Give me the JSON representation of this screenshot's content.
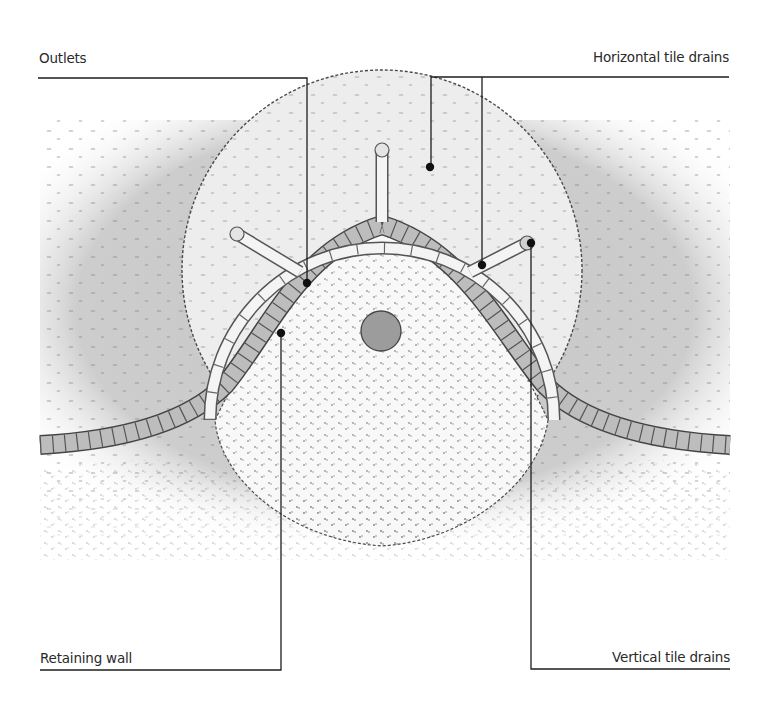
{
  "diagram": {
    "labels": {
      "outlets": "Outlets",
      "horizontal_tile_drains": "Horizontal tile drains",
      "retaining_wall": "Retaining wall",
      "vertical_tile_drains": "Vertical tile drains"
    },
    "colors": {
      "background": "#ffffff",
      "lawn": "#cfcfcf",
      "planting_bed": "#ececec",
      "gravel_area": "#f7f7f7",
      "wall_block": "#b9b9b9",
      "drain_tile": "#f4f4f4",
      "center_stone": "#9a9a9a",
      "line": "#222222"
    },
    "callouts": [
      {
        "id": "outlets",
        "anchor": [
          307,
          283
        ],
        "elbow": [
          307,
          78
        ],
        "end": [
          38,
          78
        ]
      },
      {
        "id": "horizontal_tile_drains",
        "anchors": [
          [
            430,
            167
          ],
          [
            482,
            265
          ]
        ],
        "bar_y": 77,
        "end": [
          729,
          77
        ]
      },
      {
        "id": "retaining_wall",
        "anchor": [
          281,
          333
        ],
        "elbow": [
          281,
          670
        ],
        "end": [
          40,
          670
        ]
      },
      {
        "id": "vertical_tile_drains",
        "anchor": [
          531,
          243
        ],
        "elbow": [
          531,
          669
        ],
        "end": [
          730,
          669
        ]
      }
    ]
  }
}
